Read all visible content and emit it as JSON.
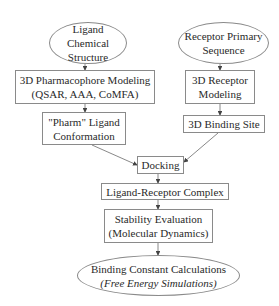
{
  "diagram": {
    "type": "flowchart",
    "nodes": {
      "ligand_structure": {
        "shape": "ellipse",
        "lines": [
          "Ligand Chemical",
          "Structure"
        ]
      },
      "receptor_sequence": {
        "shape": "ellipse",
        "lines": [
          "Receptor Primary",
          "Sequence"
        ]
      },
      "pharmacophore": {
        "shape": "box",
        "lines": [
          "3D Pharmacophore Modeling",
          "(QSAR, AAA, CoMFA)"
        ]
      },
      "receptor_modeling": {
        "shape": "box",
        "lines": [
          "3D Receptor",
          "Modeling"
        ]
      },
      "pharm_conformation": {
        "shape": "box",
        "lines": [
          "\"Pharm\" Ligand",
          "Conformation"
        ]
      },
      "binding_site": {
        "shape": "box",
        "lines": [
          "3D Binding Site"
        ]
      },
      "docking": {
        "shape": "box",
        "lines": [
          "Docking"
        ]
      },
      "complex": {
        "shape": "box",
        "lines": [
          "Ligand-Receptor Complex"
        ]
      },
      "stability": {
        "shape": "box",
        "lines": [
          "Stability Evaluation",
          "(Molecular Dynamics)"
        ]
      },
      "binding_constant": {
        "shape": "ellipse",
        "lines": [
          "Binding Constant Calculations",
          "(Free Energy Simulations)"
        ]
      }
    },
    "edges": [
      [
        "ligand_structure",
        "pharmacophore"
      ],
      [
        "pharmacophore",
        "pharm_conformation"
      ],
      [
        "receptor_sequence",
        "receptor_modeling"
      ],
      [
        "receptor_modeling",
        "binding_site"
      ],
      [
        "pharm_conformation",
        "docking"
      ],
      [
        "binding_site",
        "docking"
      ],
      [
        "docking",
        "complex"
      ],
      [
        "complex",
        "stability"
      ],
      [
        "stability",
        "binding_constant"
      ]
    ],
    "colors": {
      "line": "#6a6a6a",
      "border": "#8a8a8a",
      "text": "#2a2a2a"
    }
  }
}
